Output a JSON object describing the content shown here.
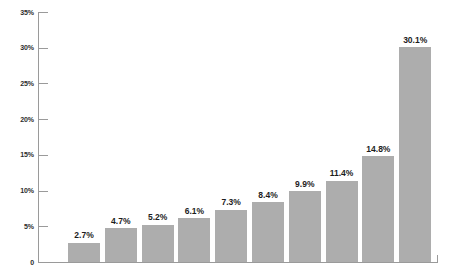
{
  "chart_data": {
    "type": "bar",
    "title": "",
    "subtitle": "",
    "xlabel": "",
    "ylabel": "",
    "categories": [
      "",
      "",
      "",
      "",
      "",
      "",
      "",
      "",
      "",
      ""
    ],
    "values": [
      2.7,
      4.7,
      5.2,
      6.1,
      7.3,
      8.4,
      9.9,
      11.4,
      14.8,
      30.1
    ],
    "data_labels": [
      "2.7%",
      "4.7%",
      "5.2%",
      "6.1%",
      "7.3%",
      "8.4%",
      "9.9%",
      "11.4%",
      "14.8%",
      "30.1%"
    ],
    "ylim": [
      0,
      35
    ],
    "ytick_values": [
      0,
      5,
      10,
      15,
      20,
      25,
      30,
      35
    ],
    "ytick_labels": [
      "0",
      "5%",
      "10%",
      "15%",
      "20%",
      "25%",
      "30%",
      "35%"
    ],
    "grid": false,
    "legend": false,
    "legend_position": "none",
    "series": [
      {
        "name": "",
        "values": [
          2.7,
          4.7,
          5.2,
          6.1,
          7.3,
          8.4,
          9.9,
          11.4,
          14.8,
          30.1
        ]
      }
    ]
  },
  "style": {
    "bar_color": "#adadad",
    "axis_color": "#9a9a9a",
    "label_color": "#1d1d1d",
    "tick_label_color": "#2b2b2b",
    "background": "#ffffff"
  }
}
